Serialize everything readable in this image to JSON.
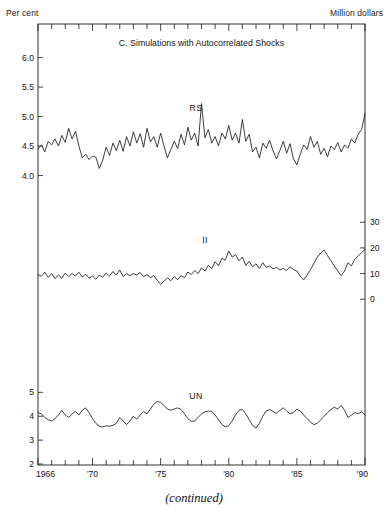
{
  "axis_units": {
    "left": "Per cent",
    "right": "Million dollars"
  },
  "caption": "(continued)",
  "chart_data": {
    "type": "line",
    "title": "C.  Simulations with Autocorrelated Shocks",
    "xlabel": "",
    "ylabel": "Per cent",
    "y2label": "Million dollars",
    "grid": false,
    "legend": "inline-series-labels",
    "x_axis": {
      "start": 1966,
      "end": 1990,
      "tick_labels": [
        "1966",
        "'70",
        "'75",
        "'80",
        "'85",
        "'90"
      ],
      "tick_label_years": [
        1966,
        1970,
        1975,
        1980,
        1985,
        1990
      ],
      "minor_tick_interval_years": 1
    },
    "panels": [
      {
        "name": "RS",
        "label": "RS",
        "units": "Per cent",
        "axis_side": "left",
        "ylim": [
          3.5,
          6.4
        ],
        "ytick_values": [
          4.0,
          4.5,
          5.0,
          5.5,
          6.0
        ],
        "ytick_labels": [
          "4.0",
          "4.5",
          "5.0",
          "5.5",
          "6.0"
        ],
        "x": [
          1966.0,
          1966.25,
          1966.5,
          1966.75,
          1967.0,
          1967.25,
          1967.5,
          1967.75,
          1968.0,
          1968.25,
          1968.5,
          1968.75,
          1969.0,
          1969.25,
          1969.5,
          1969.75,
          1970.0,
          1970.25,
          1970.5,
          1970.75,
          1971.0,
          1971.25,
          1971.5,
          1971.75,
          1972.0,
          1972.25,
          1972.5,
          1972.75,
          1973.0,
          1973.25,
          1973.5,
          1973.75,
          1974.0,
          1974.25,
          1974.5,
          1974.75,
          1975.0,
          1975.25,
          1975.5,
          1975.75,
          1976.0,
          1976.25,
          1976.5,
          1976.75,
          1977.0,
          1977.25,
          1977.5,
          1977.75,
          1978.0,
          1978.25,
          1978.5,
          1978.75,
          1979.0,
          1979.25,
          1979.5,
          1979.75,
          1980.0,
          1980.25,
          1980.5,
          1980.75,
          1981.0,
          1981.25,
          1981.5,
          1981.75,
          1982.0,
          1982.25,
          1982.5,
          1982.75,
          1983.0,
          1983.25,
          1983.5,
          1983.75,
          1984.0,
          1984.25,
          1984.5,
          1984.75,
          1985.0,
          1985.25,
          1985.5,
          1985.75,
          1986.0,
          1986.25,
          1986.5,
          1986.75,
          1987.0,
          1987.25,
          1987.5,
          1987.75,
          1988.0,
          1988.25,
          1988.5,
          1988.75,
          1989.0,
          1989.25,
          1989.5,
          1989.75,
          1990.0
        ],
        "values": [
          4.45,
          4.52,
          4.4,
          4.58,
          4.52,
          4.62,
          4.5,
          4.68,
          4.56,
          4.8,
          4.62,
          4.75,
          4.5,
          4.3,
          4.36,
          4.27,
          4.33,
          4.31,
          4.12,
          4.26,
          4.48,
          4.34,
          4.55,
          4.42,
          4.6,
          4.41,
          4.66,
          4.5,
          4.74,
          4.55,
          4.71,
          4.48,
          4.8,
          4.57,
          4.66,
          4.48,
          4.72,
          4.5,
          4.3,
          4.44,
          4.58,
          4.46,
          4.7,
          4.52,
          4.82,
          4.6,
          4.72,
          4.5,
          5.22,
          4.64,
          4.78,
          4.55,
          4.66,
          4.5,
          4.72,
          4.62,
          4.85,
          4.6,
          4.72,
          4.55,
          4.95,
          4.58,
          4.7,
          4.4,
          4.48,
          4.3,
          4.55,
          4.46,
          4.6,
          4.42,
          4.28,
          4.42,
          4.58,
          4.38,
          4.54,
          4.28,
          4.18,
          4.36,
          4.52,
          4.44,
          4.66,
          4.48,
          4.58,
          4.36,
          4.46,
          4.32,
          4.5,
          4.44,
          4.56,
          4.4,
          4.52,
          4.46,
          4.62,
          4.55,
          4.7,
          4.78,
          5.05
        ]
      },
      {
        "name": "II",
        "label": "II",
        "units": "Million dollars",
        "axis_side": "right",
        "ylim": [
          -12,
          34
        ],
        "ytick_values": [
          0,
          10,
          20,
          30
        ],
        "ytick_labels": [
          "0",
          "10",
          "20",
          "30"
        ],
        "x": [
          1966.0,
          1966.25,
          1966.5,
          1966.75,
          1967.0,
          1967.25,
          1967.5,
          1967.75,
          1968.0,
          1968.25,
          1968.5,
          1968.75,
          1969.0,
          1969.25,
          1969.5,
          1969.75,
          1970.0,
          1970.25,
          1970.5,
          1970.75,
          1971.0,
          1971.25,
          1971.5,
          1971.75,
          1972.0,
          1972.25,
          1972.5,
          1972.75,
          1973.0,
          1973.25,
          1973.5,
          1973.75,
          1974.0,
          1974.25,
          1974.5,
          1974.75,
          1975.0,
          1975.25,
          1975.5,
          1975.75,
          1976.0,
          1976.25,
          1976.5,
          1976.75,
          1977.0,
          1977.25,
          1977.5,
          1977.75,
          1978.0,
          1978.25,
          1978.5,
          1978.75,
          1979.0,
          1979.25,
          1979.5,
          1979.75,
          1980.0,
          1980.25,
          1980.5,
          1980.75,
          1981.0,
          1981.25,
          1981.5,
          1981.75,
          1982.0,
          1982.25,
          1982.5,
          1982.75,
          1983.0,
          1983.25,
          1983.5,
          1983.75,
          1984.0,
          1984.25,
          1984.5,
          1984.75,
          1985.0,
          1985.25,
          1985.5,
          1985.75,
          1986.0,
          1986.25,
          1986.5,
          1986.75,
          1987.0,
          1987.25,
          1987.5,
          1987.75,
          1988.0,
          1988.25,
          1988.5,
          1988.75,
          1989.0,
          1989.25,
          1989.5,
          1989.75,
          1990.0
        ],
        "values": [
          9.5,
          9.0,
          10.5,
          8.5,
          10.0,
          8.0,
          9.5,
          8.2,
          10.2,
          8.8,
          10.0,
          9.0,
          10.5,
          8.6,
          9.8,
          8.2,
          9.0,
          7.8,
          9.4,
          8.6,
          10.2,
          9.0,
          10.8,
          9.4,
          11.4,
          8.8,
          10.0,
          9.2,
          10.0,
          9.4,
          10.4,
          8.8,
          9.6,
          8.4,
          9.2,
          7.4,
          5.8,
          7.0,
          8.4,
          7.2,
          8.8,
          7.6,
          9.2,
          8.4,
          10.6,
          9.6,
          11.2,
          10.0,
          12.2,
          11.0,
          13.2,
          12.0,
          14.6,
          13.0,
          16.0,
          15.2,
          18.8,
          16.4,
          17.4,
          15.0,
          16.4,
          13.2,
          14.8,
          12.6,
          13.8,
          12.0,
          14.2,
          12.4,
          13.0,
          11.8,
          12.4,
          11.4,
          12.0,
          11.2,
          12.6,
          11.6,
          11.0,
          9.0,
          7.6,
          9.4,
          11.6,
          14.0,
          16.4,
          18.0,
          19.2,
          17.0,
          15.0,
          13.0,
          11.0,
          9.2,
          11.0,
          14.2,
          13.0,
          15.6,
          16.8,
          18.2,
          19.4
        ]
      },
      {
        "name": "UN",
        "label": "UN",
        "units": "Per cent",
        "axis_side": "left",
        "ylim": [
          2.0,
          5.6
        ],
        "ytick_values": [
          2,
          3,
          4,
          5
        ],
        "ytick_labels": [
          "2",
          "3",
          "4",
          "5"
        ],
        "x": [
          1966.0,
          1966.25,
          1966.5,
          1966.75,
          1967.0,
          1967.25,
          1967.5,
          1967.75,
          1968.0,
          1968.25,
          1968.5,
          1968.75,
          1969.0,
          1969.25,
          1969.5,
          1969.75,
          1970.0,
          1970.25,
          1970.5,
          1970.75,
          1971.0,
          1971.25,
          1971.5,
          1971.75,
          1972.0,
          1972.25,
          1972.5,
          1972.75,
          1973.0,
          1973.25,
          1973.5,
          1973.75,
          1974.0,
          1974.25,
          1974.5,
          1974.75,
          1975.0,
          1975.25,
          1975.5,
          1975.75,
          1976.0,
          1976.25,
          1976.5,
          1976.75,
          1977.0,
          1977.25,
          1977.5,
          1977.75,
          1978.0,
          1978.25,
          1978.5,
          1978.75,
          1979.0,
          1979.25,
          1979.5,
          1979.75,
          1980.0,
          1980.25,
          1980.5,
          1980.75,
          1981.0,
          1981.25,
          1981.5,
          1981.75,
          1982.0,
          1982.25,
          1982.5,
          1982.75,
          1983.0,
          1983.25,
          1983.5,
          1983.75,
          1984.0,
          1984.25,
          1984.5,
          1984.75,
          1985.0,
          1985.25,
          1985.5,
          1985.75,
          1986.0,
          1986.25,
          1986.5,
          1986.75,
          1987.0,
          1987.25,
          1987.5,
          1987.75,
          1988.0,
          1988.25,
          1988.5,
          1988.75,
          1989.0,
          1989.25,
          1989.5,
          1989.75,
          1990.0
        ],
        "values": [
          4.15,
          4.1,
          3.95,
          3.85,
          3.8,
          3.9,
          4.05,
          4.25,
          4.05,
          3.95,
          4.1,
          4.2,
          4.05,
          4.25,
          4.35,
          4.15,
          3.9,
          3.7,
          3.58,
          3.55,
          3.6,
          3.58,
          3.62,
          3.7,
          3.95,
          3.8,
          3.65,
          3.8,
          4.0,
          3.88,
          4.05,
          4.2,
          4.1,
          4.3,
          4.5,
          4.62,
          4.58,
          4.45,
          4.3,
          4.25,
          4.3,
          4.35,
          4.28,
          4.1,
          3.9,
          3.78,
          3.8,
          3.95,
          4.1,
          4.18,
          4.22,
          4.2,
          4.05,
          3.85,
          3.66,
          3.55,
          3.6,
          3.8,
          4.05,
          4.25,
          4.28,
          4.1,
          3.85,
          3.62,
          3.5,
          3.7,
          4.0,
          4.22,
          4.28,
          4.2,
          4.12,
          4.25,
          4.35,
          4.22,
          4.1,
          4.15,
          4.3,
          4.22,
          4.05,
          3.9,
          3.75,
          3.65,
          3.7,
          3.85,
          4.0,
          4.15,
          4.28,
          4.38,
          4.3,
          4.45,
          4.25,
          3.95,
          4.05,
          4.15,
          4.1,
          4.18,
          4.05
        ]
      }
    ]
  }
}
